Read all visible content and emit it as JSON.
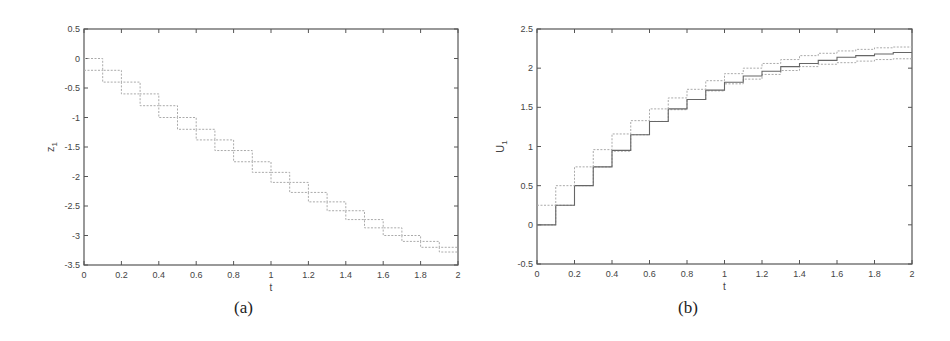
{
  "chart_data": [
    {
      "id": "a",
      "type": "line",
      "subtype": "step",
      "caption": "(a)",
      "title": "",
      "xlabel": "t",
      "ylabel": "z",
      "ylabel_subscript": "1",
      "xlim": [
        0,
        2
      ],
      "ylim": [
        -3.5,
        0.5
      ],
      "xticks": [
        "0",
        "0.2",
        "0.4",
        "0.6",
        "0.8",
        "1",
        "1.2",
        "1.4",
        "1.6",
        "1.8",
        "2"
      ],
      "yticks": [
        "0.5",
        "0",
        "-0.5",
        "-1",
        "-1.5",
        "-2",
        "-2.5",
        "-3",
        "-3.5"
      ],
      "grid": false,
      "x": [
        0,
        0.1,
        0.2,
        0.3,
        0.4,
        0.5,
        0.6,
        0.7,
        0.8,
        0.9,
        1.0,
        1.1,
        1.2,
        1.3,
        1.4,
        1.5,
        1.6,
        1.7,
        1.8,
        1.9,
        2.0
      ],
      "series": [
        {
          "name": "upper bound",
          "style": "dotted",
          "values": [
            0,
            -0.2,
            -0.4,
            -0.6,
            -0.8,
            -1.0,
            -1.2,
            -1.38,
            -1.56,
            -1.75,
            -1.93,
            -2.1,
            -2.27,
            -2.43,
            -2.58,
            -2.73,
            -2.87,
            -3.0,
            -3.1,
            -3.2
          ]
        },
        {
          "name": "lower bound",
          "style": "dotted",
          "values": [
            -0.2,
            -0.4,
            -0.6,
            -0.8,
            -1.0,
            -1.2,
            -1.38,
            -1.56,
            -1.75,
            -1.93,
            -2.1,
            -2.27,
            -2.43,
            -2.58,
            -2.73,
            -2.87,
            -3.0,
            -3.1,
            -3.2,
            -3.28
          ]
        }
      ]
    },
    {
      "id": "b",
      "type": "line",
      "subtype": "step",
      "caption": "(b)",
      "title": "",
      "xlabel": "t",
      "ylabel": "U",
      "ylabel_subscript": "1",
      "xlim": [
        0,
        2
      ],
      "ylim": [
        -0.5,
        2.5
      ],
      "xticks": [
        "0",
        "0.2",
        "0.4",
        "0.6",
        "0.8",
        "1",
        "1.2",
        "1.4",
        "1.6",
        "1.8",
        "2"
      ],
      "yticks": [
        "2.5",
        "2",
        "1.5",
        "1",
        "0.5",
        "0",
        "-0.5"
      ],
      "grid": false,
      "x": [
        0,
        0.1,
        0.2,
        0.3,
        0.4,
        0.5,
        0.6,
        0.7,
        0.8,
        0.9,
        1.0,
        1.1,
        1.2,
        1.3,
        1.4,
        1.5,
        1.6,
        1.7,
        1.8,
        1.9,
        2.0
      ],
      "series": [
        {
          "name": "lower bound",
          "style": "dotted",
          "values": [
            0,
            0.25,
            0.5,
            0.74,
            0.94,
            1.15,
            1.32,
            1.47,
            1.6,
            1.71,
            1.8,
            1.86,
            1.92,
            1.97,
            2.02,
            2.05,
            2.07,
            2.09,
            2.11,
            2.12
          ]
        },
        {
          "name": "nominal",
          "style": "solid",
          "values": [
            0,
            0.25,
            0.5,
            0.74,
            0.95,
            1.15,
            1.32,
            1.48,
            1.6,
            1.72,
            1.82,
            1.9,
            1.96,
            2.02,
            2.06,
            2.1,
            2.14,
            2.16,
            2.18,
            2.2
          ]
        },
        {
          "name": "upper bound",
          "style": "dotted",
          "values": [
            0.25,
            0.5,
            0.74,
            0.96,
            1.16,
            1.33,
            1.48,
            1.62,
            1.73,
            1.84,
            1.93,
            2.0,
            2.06,
            2.11,
            2.16,
            2.19,
            2.22,
            2.24,
            2.26,
            2.27
          ]
        }
      ]
    }
  ]
}
